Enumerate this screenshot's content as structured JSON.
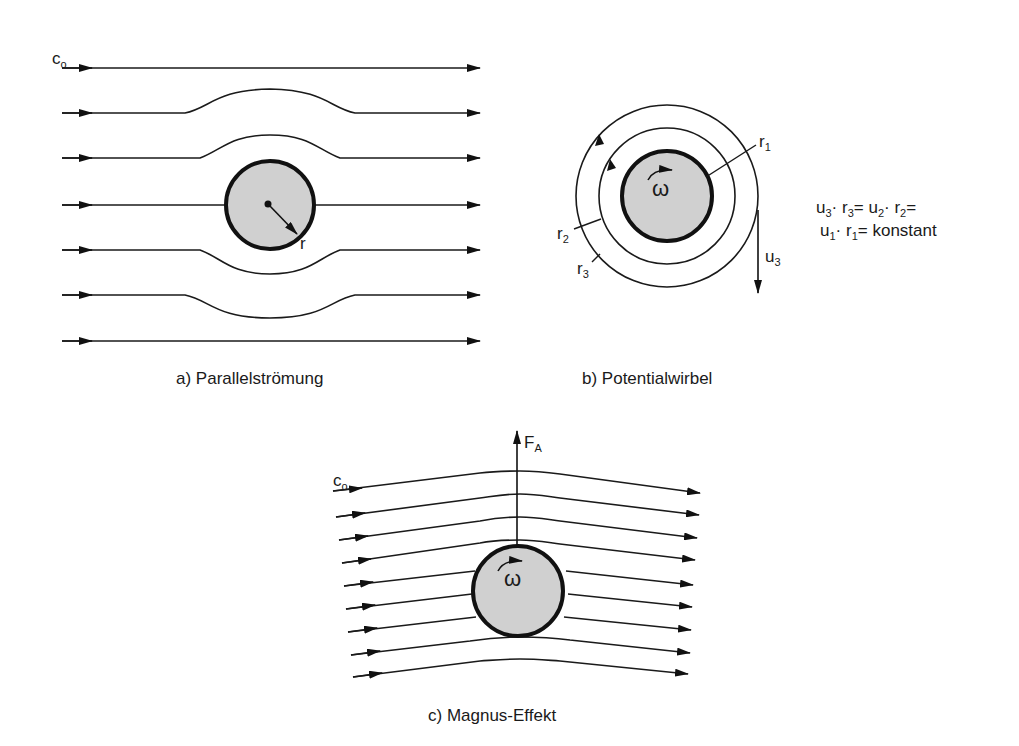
{
  "figure": {
    "panels": [
      {
        "id": "a",
        "caption": "a) Parallelströmung",
        "labels": {
          "inflow": "c",
          "inflow_sub": "o",
          "radius": "r"
        }
      },
      {
        "id": "b",
        "caption": "b) Potentialwirbel",
        "labels": {
          "omega": "ω",
          "r1": "r",
          "r1_sub": "1",
          "r2": "r",
          "r2_sub": "2",
          "r3": "r",
          "r3_sub": "3",
          "u3": "u",
          "u3_sub": "3"
        },
        "equation": {
          "line1": {
            "u": "u",
            "u_sub": "3",
            "dot1": "·",
            "r": " r",
            "r_sub": "3",
            "eq": "= u",
            "u2_sub": "2",
            "dot2": "·",
            "r2": " r",
            "r2_sub": "2",
            "tail": "="
          },
          "line2": {
            "u": "u",
            "u_sub": "1",
            "dot": "·",
            "r": "  r",
            "r_sub": "1",
            "tail": "= konstant"
          }
        }
      },
      {
        "id": "c",
        "caption": "c) Magnus-Effekt",
        "labels": {
          "inflow": "c",
          "inflow_sub": "o",
          "force": "F",
          "force_sub": "A",
          "omega": "ω"
        }
      }
    ],
    "colors": {
      "line": "#1a1a1a",
      "cylinder_fill": "#d0d0d0",
      "cylinder_stroke": "#111111",
      "background": "#ffffff"
    }
  }
}
